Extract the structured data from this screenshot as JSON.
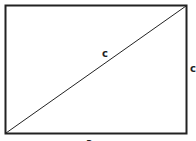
{
  "diagram": {
    "type": "rectangle-with-diagonal",
    "stroke_color": "#222222",
    "background": "#ffffff",
    "rectangle": {
      "x": 5,
      "y": 5,
      "width": 182,
      "height": 129
    },
    "labels": {
      "diagonal": "c",
      "right_side": "c",
      "bottom_side": "a"
    }
  }
}
